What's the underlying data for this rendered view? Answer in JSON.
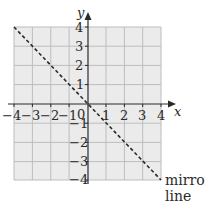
{
  "diagram": {
    "type": "coordinate-grid-reflection",
    "x_axis": {
      "label": "x",
      "range": [
        -4,
        4
      ],
      "tick_labels": [
        "−4",
        "−3",
        "−2",
        "−1",
        "0",
        "1",
        "2",
        "3",
        "4"
      ]
    },
    "y_axis": {
      "label": "y",
      "range": [
        -4,
        4
      ],
      "tick_labels": [
        "4",
        "3",
        "2",
        "1",
        "−1",
        "−2",
        "−3",
        "−4"
      ]
    },
    "origin_label": "0",
    "mirror_line": {
      "equation": "y = -x",
      "from": [
        -4,
        4
      ],
      "to": [
        4,
        -4
      ],
      "style": "dashed",
      "label_line1": "mirror",
      "label_line2": "line"
    },
    "colors": {
      "grid_fill": "#ebebeb",
      "grid_lines": "#bdbdbd",
      "axes": "#2a2a2a",
      "mirror_line": "#2a2a2a",
      "text": "#2a2a2a"
    }
  }
}
